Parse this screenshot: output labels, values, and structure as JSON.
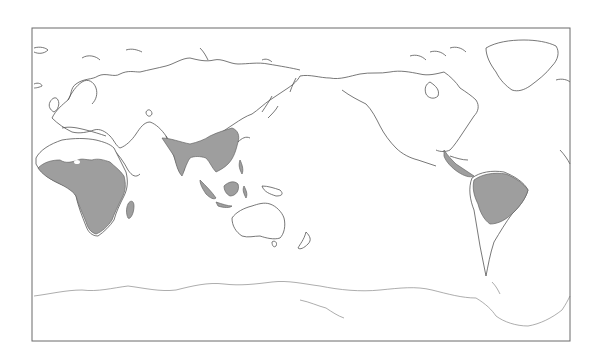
{
  "map": {
    "projection": "pacific-centered world map",
    "frame": {
      "x": 32,
      "y": 28,
      "width": 538,
      "height": 313
    },
    "colors": {
      "background": "#ffffff",
      "coastline": "#555555",
      "shaded_region": "#9e9e9e",
      "frame": "#6a6a6a"
    },
    "shaded_regions": [
      {
        "name": "sub-saharan-africa"
      },
      {
        "name": "south-and-southeast-asia"
      },
      {
        "name": "maritime-southeast-asia"
      },
      {
        "name": "central-america"
      },
      {
        "name": "northern-south-america"
      }
    ]
  }
}
